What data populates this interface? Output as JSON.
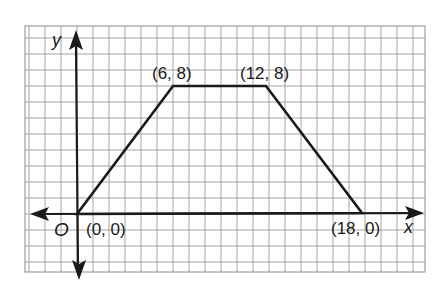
{
  "figure": {
    "type": "coordinate-grid-trapezoid",
    "axes": {
      "x_label": "x",
      "y_label": "y",
      "origin_label": "O"
    },
    "vertices": [
      {
        "x": 0,
        "y": 0,
        "label": "(0, 0)"
      },
      {
        "x": 6,
        "y": 8,
        "label": "(6, 8)"
      },
      {
        "x": 12,
        "y": 8,
        "label": "(12, 8)"
      },
      {
        "x": 18,
        "y": 0,
        "label": "(18, 0)"
      }
    ],
    "colors": {
      "grid": "#9a9a9a",
      "axis": "#1a1a1a",
      "shape": "#1a1a1a",
      "background": "#ffffff"
    }
  }
}
